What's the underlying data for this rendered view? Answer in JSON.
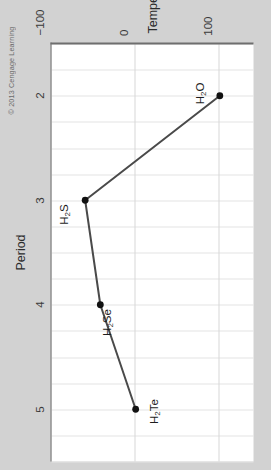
{
  "figure": {
    "credit": "© 2013 Cengage Learning",
    "background_color": "#d2d2d2",
    "plot_background_color": "#ffffff",
    "line_color": "#4a4a4a",
    "marker_color": "#111111",
    "grid_color": "#e3e3e3",
    "axis_color": "#6e6e6e"
  },
  "chart_data": {
    "type": "line",
    "title": "",
    "xlabel": "Period",
    "ylabel": "Temperature (°C)",
    "x": [
      2,
      3,
      4,
      5
    ],
    "values": [
      100,
      -60,
      -42,
      0
    ],
    "categories": [
      "H2O",
      "H2S",
      "H2Se",
      "H2Te"
    ],
    "point_labels": [
      {
        "base_a": "H",
        "sub": "2",
        "base_b": "O"
      },
      {
        "base_a": "H",
        "sub": "2",
        "base_b": "S"
      },
      {
        "base_a": "H",
        "sub": "2",
        "base_b": "Se"
      },
      {
        "base_a": "H",
        "sub": "2",
        "base_b": "Te"
      }
    ],
    "xlim": [
      1.5,
      5.5
    ],
    "ylim": [
      -100,
      140
    ],
    "xticks": [
      2,
      3,
      4,
      5
    ],
    "xticklabels": [
      "2",
      "3",
      "4",
      "5"
    ],
    "yticks": [
      -100,
      0,
      100
    ],
    "yticklabels": [
      "−100",
      "0",
      "100"
    ],
    "grid": true,
    "minor_grid_x": true,
    "legend": "none",
    "series_name": "Boiling point of Group 16 hydrides"
  }
}
